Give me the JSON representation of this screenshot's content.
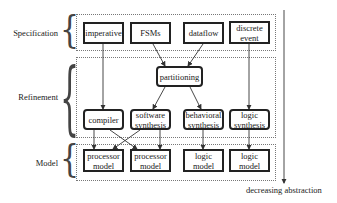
{
  "diagram": {
    "levels": [
      {
        "id": "spec",
        "label": "Specification"
      },
      {
        "id": "refine",
        "label": "Refinement"
      },
      {
        "id": "model",
        "label": "Model"
      }
    ],
    "specification": [
      "imperative",
      "FSMs",
      "dataflow",
      "discrete event"
    ],
    "partition": "partitioning",
    "refinement": [
      "compiler",
      "software synthesis",
      "behavioral synthesis",
      "logic synthesis"
    ],
    "models": [
      "processor model",
      "processor model",
      "logic model",
      "logic model"
    ],
    "axis_label": "decreasing abstraction",
    "edges": [
      [
        "imperative",
        "compiler"
      ],
      [
        "FSMs",
        "partitioning"
      ],
      [
        "dataflow",
        "partitioning"
      ],
      [
        "discrete event",
        "logic synthesis"
      ],
      [
        "partitioning",
        "software synthesis"
      ],
      [
        "partitioning",
        "behavioral synthesis"
      ],
      [
        "compiler",
        "processor model (1)"
      ],
      [
        "compiler",
        "processor model (2)"
      ],
      [
        "software synthesis",
        "processor model (1)"
      ],
      [
        "software synthesis",
        "processor model (2)"
      ],
      [
        "behavioral synthesis",
        "logic model (1)"
      ],
      [
        "logic synthesis",
        "logic model (2)"
      ]
    ]
  }
}
